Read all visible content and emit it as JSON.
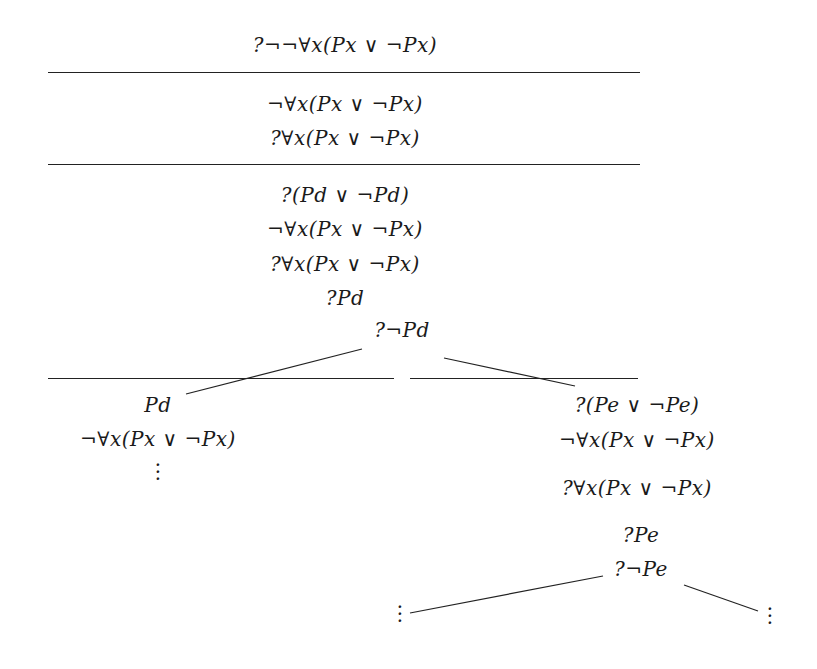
{
  "diagram": {
    "type": "tableau-proof-tree",
    "root": {
      "formula": "?¬¬∀x(Px ∨ ¬Px)"
    },
    "step1": [
      "¬∀x(Px ∨ ¬Px)",
      "?∀x(Px ∨ ¬Px)"
    ],
    "step2": [
      "?(Pd ∨ ¬Pd)",
      "¬∀x(Px ∨ ¬Px)",
      "?∀x(Px ∨ ¬Px)",
      "?Pd",
      "?¬Pd"
    ],
    "left_branch": [
      "Pd",
      "¬∀x(Px ∨ ¬Px)"
    ],
    "left_continuation": "⋮",
    "right_branch": [
      "?(Pe ∨ ¬Pe)",
      "¬∀x(Px ∨ ¬Px)",
      "?∀x(Px ∨ ¬Px)",
      "?Pe",
      "?¬Pe"
    ],
    "right_left_continuation": "⋮",
    "right_right_continuation": "⋮"
  }
}
